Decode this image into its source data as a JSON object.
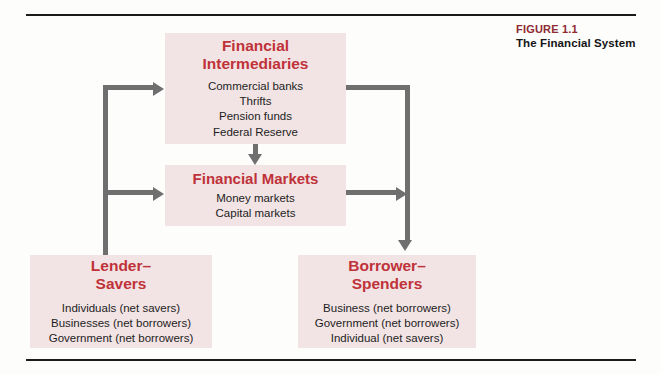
{
  "caption": {
    "figure_number": "FIGURE 1.1",
    "figure_title": "The Financial System"
  },
  "colors": {
    "node_fill": "#f2e4e4",
    "node_title": "#bf3239",
    "caption_number": "#8f2a31",
    "connector": "#6f6f6f",
    "rule": "#1b1b1b"
  },
  "diagram": {
    "type": "flow-diagram",
    "nodes": [
      {
        "id": "financial-intermediaries",
        "title": "Financial\nIntermediaries",
        "items": "Commercial banks\nThrifts\nPension funds\nFederal Reserve"
      },
      {
        "id": "financial-markets",
        "title": "Financial Markets",
        "items": "Money markets\nCapital markets"
      },
      {
        "id": "lender-savers",
        "title": "Lender–\nSavers",
        "items": "Individuals  (net savers)\nBusinesses  (net borrowers)\nGovernment  (net borrowers)"
      },
      {
        "id": "borrower-spenders",
        "title": "Borrower–\nSpenders",
        "items": "Business  (net borrowers)\nGovernment  (net borrowers)\nIndividual  (net savers)"
      }
    ],
    "edges": [
      {
        "from": "lender-savers",
        "to": "financial-intermediaries",
        "direction": "right"
      },
      {
        "from": "lender-savers",
        "to": "financial-markets",
        "direction": "right"
      },
      {
        "from": "financial-intermediaries",
        "to": "financial-markets",
        "direction": "down"
      },
      {
        "from": "financial-intermediaries",
        "to": "borrower-spenders",
        "direction": "down"
      },
      {
        "from": "financial-markets",
        "to": "borrower-spenders",
        "direction": "right"
      }
    ]
  }
}
